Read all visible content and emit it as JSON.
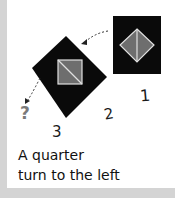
{
  "illustration": {
    "steps": [
      {
        "label": "1",
        "shape": "square-with-diamond",
        "orientation": "upright"
      },
      {
        "label": "2",
        "shape": "diamond-with-square",
        "orientation": "rotated-45"
      },
      {
        "label": "3",
        "shape": "unknown",
        "symbol": "?"
      }
    ],
    "arrows": [
      "dotted-arrow-1-to-2",
      "dotted-arrow-2-to-3"
    ],
    "colors": {
      "tile": "#0a0a0a",
      "inner": "#6e6e6e",
      "outline": "#e0e0e0",
      "question": "#7a7a7a",
      "frame": "#d4d4d4"
    }
  },
  "caption": {
    "line1": "A quarter",
    "line2": "turn to the left"
  }
}
